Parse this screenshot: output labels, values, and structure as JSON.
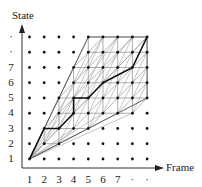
{
  "diagram": {
    "type": "trellis-lattice",
    "y_axis_label": "State",
    "x_axis_label": "Frame",
    "y_ticks": [
      "1",
      "2",
      "3",
      "4",
      "5",
      "6",
      "7",
      "·",
      "·"
    ],
    "x_ticks": [
      "1",
      "2",
      "3",
      "4",
      "5",
      "6",
      "7",
      "·",
      "·"
    ],
    "grid": {
      "cols": 9,
      "rows": 9
    },
    "lattice_columns": [
      {
        "col": 1,
        "rows": [
          1,
          1
        ]
      },
      {
        "col": 2,
        "rows": [
          2,
          3
        ]
      },
      {
        "col": 3,
        "rows": [
          2,
          5
        ]
      },
      {
        "col": 4,
        "rows": [
          3,
          7
        ]
      },
      {
        "col": 5,
        "rows": [
          3,
          9
        ]
      },
      {
        "col": 6,
        "rows": [
          4,
          9
        ]
      },
      {
        "col": 7,
        "rows": [
          4,
          9
        ]
      },
      {
        "col": 8,
        "rows": [
          4,
          9
        ]
      },
      {
        "col": 9,
        "rows": [
          5,
          9
        ]
      }
    ],
    "boundary": [
      [
        1,
        1
      ],
      [
        5,
        9
      ],
      [
        9,
        9
      ],
      [
        9,
        5
      ],
      [
        1,
        1
      ]
    ],
    "best_path": [
      [
        1,
        1
      ],
      [
        2,
        3
      ],
      [
        3,
        3
      ],
      [
        4,
        4
      ],
      [
        4,
        5
      ],
      [
        5,
        5
      ],
      [
        6,
        6
      ],
      [
        8,
        7
      ],
      [
        9,
        9
      ]
    ],
    "colors": {
      "dots": "#111111",
      "lattice": "#8a8a8a",
      "path": "#111111",
      "axis": "#333333"
    }
  }
}
